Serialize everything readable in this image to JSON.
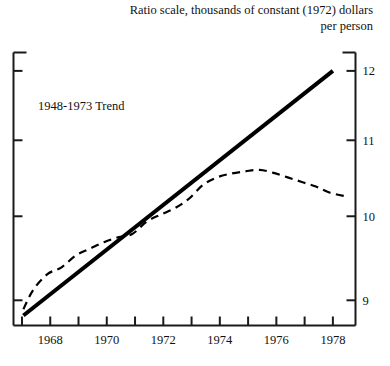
{
  "title": {
    "line1": "Ratio scale, thousands of constant (1972) dollars",
    "line2": "per person"
  },
  "colors": {
    "axis": "#1a1a1a",
    "trend_line": "#000000",
    "data_line": "#000000",
    "background": "#ffffff",
    "text": "#111111"
  },
  "annotations": [
    {
      "text": "1948-1973 Trend",
      "x": 1969.1,
      "y": 11.42
    }
  ],
  "chart_data": {
    "type": "line",
    "title": "Ratio scale, thousands of constant (1972) dollars per person",
    "subtitle": "per person",
    "xlabel": "",
    "ylabel": "thousands of constant (1972) dollars per person",
    "y_scale": "ratio (log)",
    "xlim": [
      1966.7,
      1978.8
    ],
    "ylim": [
      8.72,
      12.28
    ],
    "grid": false,
    "legend": "none",
    "y_axis_position": "right",
    "x_ticks": [
      1967,
      1968,
      1969,
      1970,
      1971,
      1972,
      1973,
      1974,
      1975,
      1976,
      1977,
      1978
    ],
    "x_tick_labels": [
      "",
      "1968",
      "",
      "1970",
      "",
      "1972",
      "",
      "1974",
      "",
      "1976",
      "",
      "1978"
    ],
    "y_ticks": [
      9,
      10,
      11,
      12
    ],
    "y_tick_labels": [
      "9",
      "10",
      "11",
      "12"
    ],
    "series": [
      {
        "name": "1948-1973 Trend",
        "style": "solid",
        "width": 4,
        "x": [
          1967.05,
          1978.0
        ],
        "values": [
          8.83,
          12.0
        ]
      },
      {
        "name": "Actual",
        "style": "dashed",
        "width": 2.2,
        "x": [
          1967.05,
          1967.4,
          1967.9,
          1968.4,
          1968.9,
          1969.4,
          1969.9,
          1970.4,
          1970.9,
          1971.4,
          1971.9,
          1972.4,
          1972.9,
          1973.4,
          1973.9,
          1974.4,
          1974.9,
          1975.4,
          1975.9,
          1976.4,
          1976.9,
          1977.4,
          1977.9,
          1978.5
        ],
        "values": [
          8.9,
          9.12,
          9.3,
          9.38,
          9.52,
          9.6,
          9.68,
          9.74,
          9.78,
          9.93,
          10.02,
          10.1,
          10.22,
          10.4,
          10.5,
          10.55,
          10.58,
          10.6,
          10.56,
          10.5,
          10.44,
          10.38,
          10.3,
          10.25
        ]
      }
    ]
  }
}
